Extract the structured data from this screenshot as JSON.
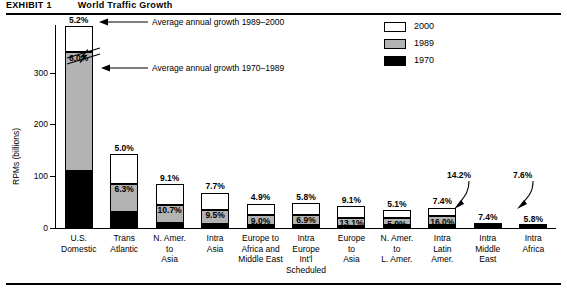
{
  "title": {
    "number": "EXHIBIT 1",
    "text": "World Traffic Growth"
  },
  "legend": {
    "position": "top-right",
    "entries": [
      {
        "label": "2000",
        "color": "#ffffff",
        "key": "s2000"
      },
      {
        "label": "1989",
        "color": "#b3b3b3",
        "key": "s1989"
      },
      {
        "label": "1970",
        "color": "#000000",
        "key": "s1970"
      }
    ]
  },
  "annotations": [
    {
      "name": "annotation-growth-1989-2000",
      "text": "Average annual growth 1989–2000"
    },
    {
      "name": "annotation-growth-1970-1989",
      "text": "Average annual growth 1970–1989"
    }
  ],
  "axis": {
    "y_title": "RPMs (billions)",
    "y_ticks": [
      "0",
      "100",
      "200",
      "300"
    ],
    "y_values": [
      0,
      100,
      200,
      300
    ],
    "axis_break": true
  },
  "chart_data": {
    "type": "bar",
    "subtype": "stacked-bar",
    "title": "World Traffic Growth",
    "xlabel": "",
    "ylabel": "RPMs (billions)",
    "ylim": [
      0,
      420
    ],
    "grid": false,
    "legend_position": "top-right",
    "axis_break_note": "First bar (U.S. Domestic) is drawn with a broken-axis zigzag; its 2000 total exceeds the plotted scale.",
    "categories": [
      "U.S. Domestic",
      "Trans Atlantic",
      "N. Amer. to Asia",
      "Intra Asia",
      "Europe to Africa and Middle East",
      "Intra Europe Int'l Scheduled",
      "Europe to Asia",
      "N. Amer. to L. Amer.",
      "Intra Latin Amer.",
      "Intra Middle East",
      "Intra Africa"
    ],
    "category_lines": [
      [
        "U.S.",
        "Domestic"
      ],
      [
        "Trans",
        "Atlantic"
      ],
      [
        "N. Amer.",
        "to",
        "Asia"
      ],
      [
        "Intra",
        "Asia"
      ],
      [
        "Europe to",
        "Africa and",
        "Middle East"
      ],
      [
        "Intra",
        "Europe",
        "Int'l",
        "Scheduled"
      ],
      [
        "Europe",
        "to",
        "Asia"
      ],
      [
        "N. Amer.",
        "to",
        "L. Amer."
      ],
      [
        "Intra",
        "Latin",
        "Amer."
      ],
      [
        "Intra",
        "Middle",
        "East"
      ],
      [
        "Intra",
        "Africa"
      ]
    ],
    "series": [
      {
        "name": "1970",
        "color": "#000000",
        "values": [
          110,
          31,
          9,
          7,
          5,
          6,
          3,
          5,
          6,
          2,
          1
        ]
      },
      {
        "name": "1989",
        "color": "#b3b3b3",
        "values": [
          230,
          55,
          36,
          28,
          20,
          20,
          17,
          14,
          17,
          3,
          2
        ]
      },
      {
        "name": "2000",
        "color": "#ffffff",
        "values": [
          100,
          57,
          40,
          33,
          22,
          22,
          22,
          15,
          16,
          3,
          2
        ]
      }
    ],
    "growth_labels_1970_1989": [
      "6.0%",
      "6.3%",
      "10.7%",
      "9.5%",
      "9.0%",
      "6.9%",
      "13.1%",
      "5.9%",
      "16.0%",
      "14.2%",
      "7.6%"
    ],
    "growth_labels_1989_2000": [
      "5.2%",
      "5.0%",
      "9.1%",
      "7.7%",
      "4.9%",
      "5.8%",
      "9.1%",
      "5.1%",
      "7.4%",
      "7.4%",
      "5.8%"
    ],
    "callout_labels": [
      {
        "category": "Intra Middle East",
        "value": "14.2%",
        "series": "1970–1989"
      },
      {
        "category": "Intra Africa",
        "value": "7.6%",
        "series": "1970–1989"
      }
    ]
  }
}
